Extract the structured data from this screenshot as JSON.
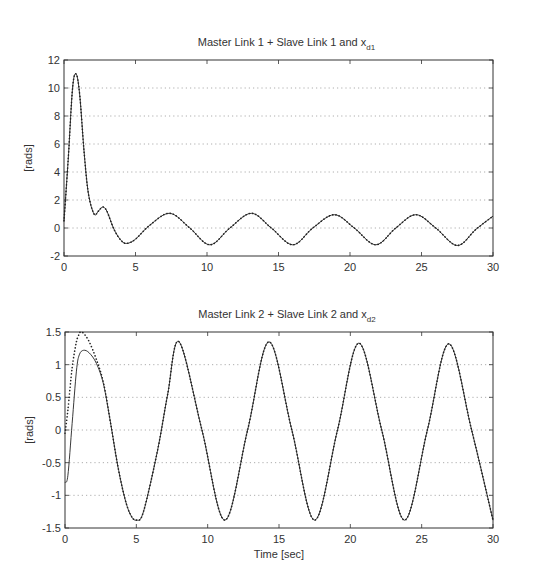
{
  "figure": {
    "xlabel": "Time [sec]"
  },
  "chart_data": [
    {
      "type": "line",
      "title": "Master Link 1 + Slave Link 1 and x",
      "title_subscript": "d1",
      "xlabel": "",
      "ylabel": "[rads]",
      "xlim": [
        0,
        30
      ],
      "ylim": [
        -2,
        12
      ],
      "xticks": [
        0,
        5,
        10,
        15,
        20,
        25,
        30
      ],
      "yticks": [
        -2,
        0,
        2,
        4,
        6,
        8,
        10,
        12
      ],
      "grid": "horizontal dotted",
      "legend": "none",
      "series": [
        {
          "name": "Master/Slave Link 1 (solid)",
          "style": "solid",
          "x": [
            0,
            0.3,
            0.6,
            0.85,
            1.1,
            1.4,
            1.7,
            2.1,
            2.4,
            2.7,
            3.0,
            3.5,
            4.0,
            4.4,
            5.0,
            6.0,
            7.4,
            8.8,
            10.2,
            11.6,
            13.1,
            14.5,
            16.0,
            17.4,
            18.9,
            20.3,
            21.8,
            23.2,
            24.6,
            26.0,
            27.5,
            28.8,
            30
          ],
          "values": [
            0.5,
            5.0,
            10.0,
            11.0,
            9.5,
            5.5,
            2.5,
            1.0,
            1.2,
            1.5,
            1.2,
            -0.1,
            -0.9,
            -1.1,
            -0.8,
            0.2,
            1.05,
            0.0,
            -1.2,
            0.0,
            1.05,
            0.0,
            -1.2,
            0.0,
            0.95,
            0.0,
            -1.2,
            0.0,
            0.95,
            0.0,
            -1.25,
            -0.1,
            0.85
          ]
        },
        {
          "name": "x_d1 (dotted)",
          "style": "dotted",
          "x": [
            0,
            0.3,
            0.6,
            0.85,
            1.1,
            1.4,
            1.7,
            2.1,
            2.4,
            2.7,
            3.0,
            3.5,
            4.0,
            4.4,
            5.0,
            6.0,
            7.4,
            8.8,
            10.2,
            11.6,
            13.1,
            14.5,
            16.0,
            17.4,
            18.9,
            20.3,
            21.8,
            23.2,
            24.6,
            26.0,
            27.5,
            28.8,
            30
          ],
          "values": [
            0.5,
            5.0,
            10.0,
            11.0,
            9.5,
            5.5,
            2.5,
            1.0,
            1.2,
            1.5,
            1.2,
            -0.1,
            -0.9,
            -1.1,
            -0.8,
            0.2,
            1.05,
            0.0,
            -1.2,
            0.0,
            1.05,
            0.0,
            -1.2,
            0.0,
            0.95,
            0.0,
            -1.2,
            0.0,
            0.95,
            0.0,
            -1.25,
            -0.1,
            0.85
          ]
        }
      ]
    },
    {
      "type": "line",
      "title": "Master Link 2 + Slave Link 2 and x",
      "title_subscript": "d2",
      "xlabel": "Time [sec]",
      "ylabel": "[rads]",
      "xlim": [
        0,
        30
      ],
      "ylim": [
        -1.5,
        1.5
      ],
      "xticks": [
        0,
        5,
        10,
        15,
        20,
        25,
        30
      ],
      "yticks": [
        -1.5,
        -1,
        -0.5,
        0,
        0.5,
        1,
        1.5
      ],
      "grid": "horizontal dotted",
      "legend": "none",
      "series": [
        {
          "name": "Master/Slave Link 2 (solid)",
          "style": "solid",
          "x": [
            0,
            0.2,
            0.5,
            0.8,
            1.0,
            1.3,
            1.7,
            2.2,
            2.7,
            3.2,
            3.7,
            4.2,
            4.6,
            5.0,
            5.5,
            6.5,
            7.2,
            8.0,
            9.6,
            11.2,
            12.8,
            14.3,
            15.9,
            17.5,
            19.1,
            20.6,
            22.2,
            23.8,
            25.4,
            26.9,
            28.5,
            30
          ],
          "values": [
            -0.8,
            -0.7,
            0.1,
            0.9,
            1.15,
            1.22,
            1.18,
            1.02,
            0.7,
            0.1,
            -0.55,
            -1.05,
            -1.3,
            -1.38,
            -1.25,
            -0.3,
            0.55,
            1.35,
            0.0,
            -1.38,
            0.0,
            1.35,
            0.0,
            -1.38,
            0.0,
            1.33,
            0.0,
            -1.38,
            0.0,
            1.32,
            0.0,
            -1.38
          ]
        },
        {
          "name": "x_d2 (dotted)",
          "style": "dotted",
          "x": [
            0,
            0.2,
            0.5,
            0.8,
            1.0,
            1.1,
            1.3,
            1.7,
            2.2,
            2.7,
            3.2,
            3.7,
            4.2,
            4.6,
            5.0,
            5.5,
            6.5,
            7.2,
            8.0,
            9.6,
            11.2,
            12.8,
            14.3,
            15.9,
            17.5,
            19.1,
            20.6,
            22.2,
            23.8,
            25.4,
            26.9,
            28.5,
            30
          ],
          "values": [
            -0.05,
            0.3,
            0.95,
            1.35,
            1.47,
            1.5,
            1.48,
            1.35,
            1.08,
            0.72,
            0.1,
            -0.55,
            -1.05,
            -1.3,
            -1.38,
            -1.25,
            -0.3,
            0.55,
            1.35,
            0.0,
            -1.38,
            0.0,
            1.35,
            0.0,
            -1.38,
            0.0,
            1.33,
            0.0,
            -1.38,
            0.0,
            1.32,
            0.0,
            -1.38
          ]
        }
      ]
    }
  ]
}
